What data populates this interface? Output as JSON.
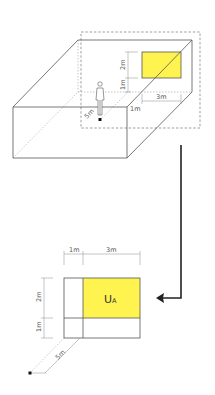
{
  "diagram": {
    "colors": {
      "stroke": "#555555",
      "dashed": "#777777",
      "target": "#fff44f",
      "target_border": "#555555",
      "arrow": "#222222"
    },
    "perspective_view": {
      "labels": {
        "target_height": "2m",
        "target_offset_height": "1m",
        "target_width": "3m",
        "target_offset_side": "1m",
        "viewing_distance": "5m"
      }
    },
    "plan_view": {
      "labels": {
        "left_width": "1m",
        "target_width": "3m",
        "target_height": "2m",
        "bottom_height": "1m",
        "viewing_distance": "5m"
      },
      "target_label": "U",
      "target_label_sub": "A"
    }
  }
}
